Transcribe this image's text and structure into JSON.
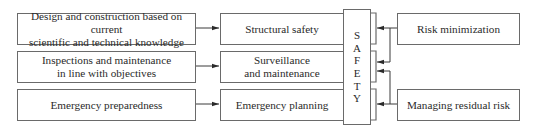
{
  "diagram": {
    "center": {
      "letters": [
        "S",
        "A",
        "F",
        "E",
        "T",
        "Y"
      ]
    },
    "left_column": [
      {
        "lines": [
          "Design and construction based on current",
          "scientific and technical knowledge"
        ]
      },
      {
        "lines": [
          "Inspections and maintenance",
          "in line with objectives"
        ]
      },
      {
        "lines": [
          "Emergency preparedness"
        ]
      }
    ],
    "middle_column": [
      {
        "lines": [
          "Structural safety"
        ]
      },
      {
        "lines": [
          "Surveillance",
          "and maintenance"
        ]
      },
      {
        "lines": [
          "Emergency planning"
        ]
      }
    ],
    "right_column": [
      {
        "lines": [
          "Risk minimization"
        ]
      },
      {
        "lines": [
          "Managing residual risk"
        ]
      }
    ],
    "colors": {
      "line": "#6a6a6a",
      "arrow": "#2a2a2a",
      "text": "#2a2a2a"
    }
  }
}
